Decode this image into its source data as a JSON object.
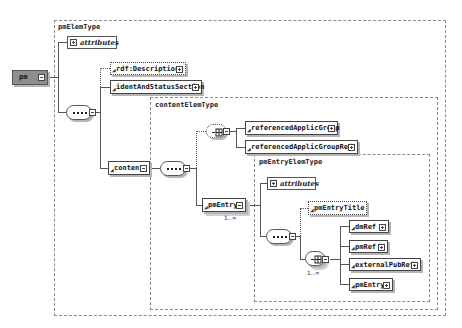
{
  "diagram": {
    "root": {
      "name": "pm"
    },
    "types": {
      "pmElemType": "pmElemType",
      "contentElemType": "contentElemType",
      "pmEntryElemType": "pmEntryElemType"
    },
    "attributes_label": "attributes",
    "elements": {
      "rdfDescription": "rdf:Description",
      "identAndStatusSection": "identAndStatusSection",
      "content": "content",
      "referencedApplicGroup": "referencedApplicGroup",
      "referencedApplicGroupRef": "referencedApplicGroupRef",
      "pmEntry": "pmEntry",
      "pmEntryTitle": "pmEntryTitle",
      "dmRef": "dmRef",
      "pmRef": "pmRef",
      "externalPubRef": "externalPubRef",
      "pmEntryNested": "pmEntry"
    },
    "cardinality": {
      "pmEntry": "1..∞",
      "choice": "1..∞"
    },
    "colors": {
      "root_fill": "#8e8e8e",
      "border": "#444444",
      "shadow": "#b5b5b5",
      "dashed_border": "#8a8a8a"
    }
  }
}
